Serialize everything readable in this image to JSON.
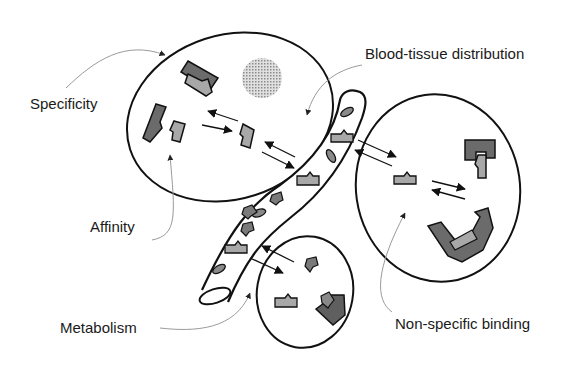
{
  "diagram": {
    "labels": {
      "specificity": "Specificity",
      "affinity": "Affinity",
      "blood_tissue": "Blood-tissue distribution",
      "metabolism": "Metabolism",
      "non_specific": "Non-specific binding"
    },
    "colors": {
      "outline": "#111111",
      "dark_fill": "#6b6b6b",
      "light_fill": "#a8a8a8",
      "leader_line": "#9a9a9a",
      "nucleus": "#bdbdbd"
    },
    "compartments": [
      {
        "name": "cell-top-left",
        "shape": "ellipse"
      },
      {
        "name": "blood-vessel",
        "shape": "tube"
      },
      {
        "name": "cell-right",
        "shape": "ellipse"
      },
      {
        "name": "cell-bottom",
        "shape": "ellipse"
      }
    ]
  }
}
